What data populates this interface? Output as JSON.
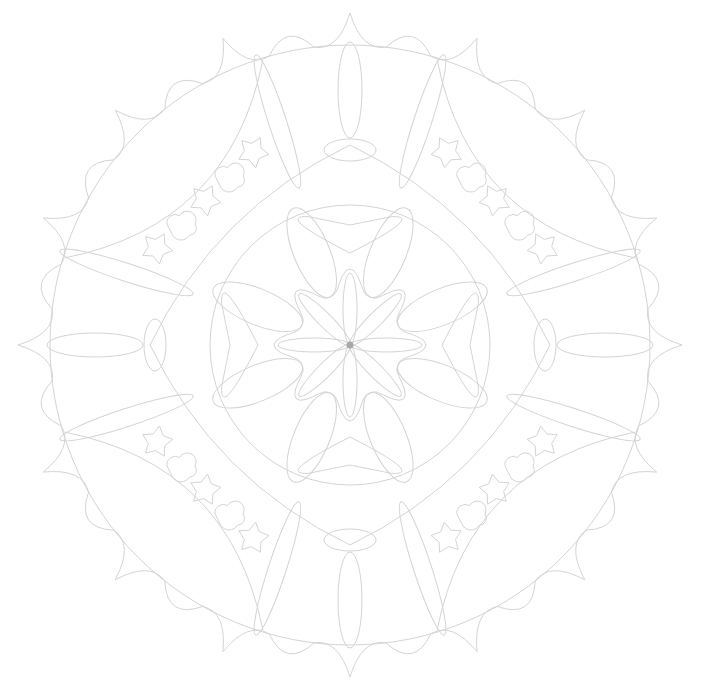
{
  "page": {
    "kind": "mandala coloring page",
    "background": "#ffffff",
    "line_color": "#d4d4d4",
    "center_dot_color": "#a8a8a8"
  },
  "mandala": {
    "center": [
      350,
      345
    ],
    "outer_spikes": {
      "count": 16,
      "radius_tip": 332,
      "radius_base": 300
    },
    "outer_scallops": {
      "count": 16,
      "radius": 308,
      "bump": 22
    },
    "outer_circle_radius": 300,
    "frame_square": {
      "half_diag": 290
    },
    "cardinal_ellipses": {
      "distance": 195,
      "rx": 26,
      "ry": 11
    },
    "outer_petals": {
      "distance": 240,
      "rx": 100,
      "ry": 13
    },
    "inner_circle_radius": 140,
    "inner_petals": {
      "count": 8,
      "distance": 100,
      "rx": 48,
      "ry": 18
    },
    "center_flower": {
      "count": 8,
      "length": 72,
      "width": 14
    },
    "center_dot_radius": 3.5
  }
}
